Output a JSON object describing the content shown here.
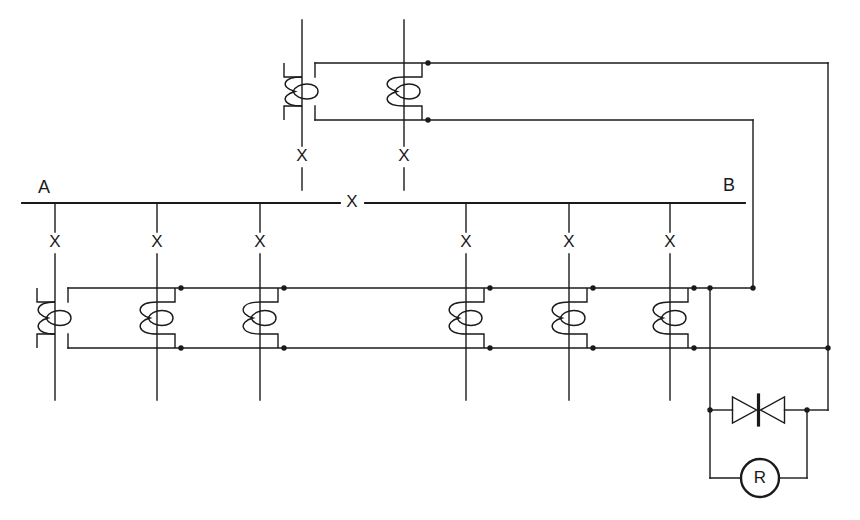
{
  "diagram": {
    "type": "electrical-schematic",
    "colors": {
      "background": "#ffffff",
      "line": "#1a1a1a",
      "junction": "#1a1a1a",
      "text": "#1a1a1a"
    },
    "stroke_width": 1.4,
    "terminals": [
      {
        "name": "terminal-a",
        "label": "A",
        "x": 44,
        "y": 188
      },
      {
        "name": "terminal-b",
        "label": "B",
        "x": 729,
        "y": 186
      }
    ],
    "bus": {
      "name": "main-bus-ab",
      "y": 203,
      "x_start": 22,
      "x_end": 745,
      "gap_start": 340,
      "gap_end": 365,
      "inline_marker": {
        "label": "X",
        "x": 352,
        "y": 203
      }
    },
    "lower_branches": {
      "label": "X",
      "marker_y": 243,
      "x_positions": [
        55,
        157,
        260,
        466,
        569,
        670
      ],
      "y_top": 203,
      "y_bottom": 400
    },
    "upper_branches": {
      "label": "X",
      "marker_y": 157,
      "x_positions": [
        302,
        404
      ],
      "y_top": 20,
      "y_bottom": 190
    },
    "upper_coil_block": {
      "name": "upper-coil-pair",
      "rail_top_y": 63,
      "rail_bottom_y": 120,
      "rail_x_left": 315,
      "rail_top_x_right": 828,
      "rail_bottom_x_right": 753,
      "coils": [
        {
          "x": 302,
          "step": "left",
          "dots": false
        },
        {
          "x": 404,
          "step": "right",
          "dots": true
        }
      ]
    },
    "lower_coil_block": {
      "name": "lower-coil-bank",
      "rail_top_y": 288,
      "rail_bottom_y": 348,
      "rail_x_left": 68,
      "rail_top_x_right": 753,
      "rail_bottom_x_right": 828,
      "coils": [
        {
          "x": 55,
          "step": "left",
          "dots": false
        },
        {
          "x": 157,
          "step": "right",
          "dots": true
        },
        {
          "x": 260,
          "step": "right",
          "dots": true
        },
        {
          "x": 466,
          "step": "right",
          "dots": true
        },
        {
          "x": 569,
          "step": "right",
          "dots": true
        },
        {
          "x": 670,
          "step": "right",
          "dots": true
        }
      ]
    },
    "right_network": {
      "name": "protection-network",
      "feed_x": 710,
      "return_x": 828,
      "diode_y": 410,
      "resistor_y": 478,
      "bottom_left_x": 710,
      "bottom_right_x": 807
    },
    "components": [
      {
        "name": "zener-diode-bidirectional",
        "label": "",
        "type": "bidirectional-zener",
        "x_left": 710,
        "x_right": 807,
        "y": 410
      },
      {
        "name": "resistor-element",
        "label": "R",
        "type": "circle-component",
        "cx": 760,
        "cy": 478,
        "r": 19
      }
    ],
    "junction_dots": [
      {
        "x": 428,
        "y": 63
      },
      {
        "x": 428,
        "y": 120
      },
      {
        "x": 181,
        "y": 288
      },
      {
        "x": 181,
        "y": 348
      },
      {
        "x": 284,
        "y": 288
      },
      {
        "x": 284,
        "y": 348
      },
      {
        "x": 490,
        "y": 288
      },
      {
        "x": 490,
        "y": 348
      },
      {
        "x": 593,
        "y": 288
      },
      {
        "x": 593,
        "y": 348
      },
      {
        "x": 694,
        "y": 288
      },
      {
        "x": 694,
        "y": 348
      },
      {
        "x": 710,
        "y": 288
      },
      {
        "x": 753,
        "y": 288
      },
      {
        "x": 828,
        "y": 348
      },
      {
        "x": 710,
        "y": 410
      },
      {
        "x": 807,
        "y": 410
      }
    ]
  }
}
